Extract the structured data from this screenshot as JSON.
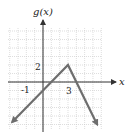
{
  "chart_data": {
    "type": "line",
    "title": "",
    "xlabel": "x",
    "ylabel": "g(x)",
    "grid": true,
    "xlim": [
      -4,
      7
    ],
    "ylim": [
      -6,
      6
    ],
    "tick_labels": [
      {
        "axis": "y",
        "value": 2,
        "text": "2"
      },
      {
        "axis": "y",
        "value": -1,
        "text": "-1"
      },
      {
        "axis": "x",
        "value": 3,
        "text": "3"
      }
    ],
    "series": [
      {
        "name": "g(x)",
        "points": [
          [
            -3.7,
            -4.7
          ],
          [
            0,
            -1
          ],
          [
            3,
            2
          ],
          [
            6.5,
            -5
          ]
        ],
        "arrows": "both-ends",
        "color": "#6e6e6e"
      }
    ],
    "key_points": [
      {
        "label": "y-intercept",
        "x": 0,
        "y": -1
      },
      {
        "label": "vertex",
        "x": 3,
        "y": 2
      }
    ]
  },
  "labels": {
    "y_axis": "g(x)",
    "x_axis": "x",
    "tick_y2": "2",
    "tick_ym1": "-1",
    "tick_x3": "3"
  },
  "colors": {
    "grid": "#c8c8c8",
    "axis": "#333333",
    "curve": "#6e6e6e"
  }
}
